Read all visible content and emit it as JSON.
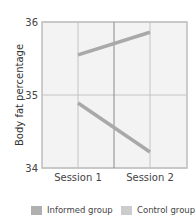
{
  "chart_data": {
    "type": "line",
    "title": "",
    "xlabel": "",
    "ylabel": "Body fat percentage",
    "categories": [
      "Session 1",
      "Session 2"
    ],
    "ylim": [
      34,
      36
    ],
    "yticks": [
      34,
      35,
      36
    ],
    "grid": true,
    "legend_position": "bottom",
    "series": [
      {
        "name": "Control group",
        "values": [
          35.55,
          35.86
        ],
        "color": "#a9a9a9"
      },
      {
        "name": "Informed group",
        "values": [
          34.89,
          34.22
        ],
        "color": "#a9a9a9"
      }
    ]
  },
  "legend": [
    {
      "label": "Informed group",
      "color": "#b0b0b0"
    },
    {
      "label": "Control group",
      "color": "#cccccc"
    }
  ],
  "colors": {
    "plot_bg": "#f3f3f3",
    "grid": "#c4c4c4",
    "center_line": "#8a8a8a",
    "border": "#bdbdbd"
  }
}
